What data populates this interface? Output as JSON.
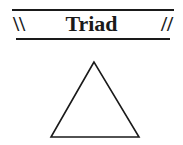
{
  "header": {
    "title": "Triad",
    "left_mark": "\\\\",
    "right_mark": "//"
  },
  "figure": {
    "shape": "triangle",
    "stroke_color": "#1a1a1a",
    "points": "94,62 51,137 139,137"
  }
}
